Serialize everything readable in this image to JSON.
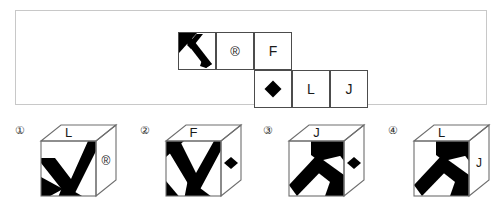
{
  "question_panel": {
    "name": "unfolded-cube-net",
    "net": {
      "rows": [
        {
          "row": 0,
          "cells": [
            {
              "col": 0,
              "kind": "k-arrow-glyph",
              "label": ""
            },
            {
              "col": 1,
              "kind": "text",
              "label": "®"
            },
            {
              "col": 2,
              "kind": "text",
              "label": "F"
            }
          ]
        },
        {
          "row": 1,
          "cells": [
            {
              "col": 2,
              "kind": "diamond-glyph",
              "label": ""
            },
            {
              "col": 3,
              "kind": "text",
              "label": "L"
            },
            {
              "col": 4,
              "kind": "text",
              "label": "J"
            }
          ]
        }
      ],
      "symbols": {
        "registered": "®",
        "diamond": "◆",
        "k_arrow": "k-arrow",
        "letter_f": "F",
        "letter_l": "L",
        "letter_j": "J"
      }
    }
  },
  "options": [
    {
      "number": "①",
      "number_plain": "1",
      "top_face_label": "L",
      "right_face_label": "®",
      "front_face_glyph": "k-arrow-rotated",
      "right_face_glyph": ""
    },
    {
      "number": "②",
      "number_plain": "2",
      "top_face_label": "F",
      "right_face_label": "",
      "front_face_glyph": "k-arrow-rotated",
      "right_face_glyph": "diamond"
    },
    {
      "number": "③",
      "number_plain": "3",
      "top_face_label": "J",
      "right_face_label": "",
      "front_face_glyph": "k-arrow-tilted",
      "right_face_glyph": "diamond"
    },
    {
      "number": "④",
      "number_plain": "4",
      "top_face_label": "L",
      "right_face_label": "J",
      "front_face_glyph": "k-arrow-tilted",
      "right_face_glyph": ""
    }
  ],
  "colors": {
    "ink": "#000000",
    "cell_border": "#4c4c4c",
    "panel_border": "#c8c8c8",
    "cube_line": "#6e6e6e",
    "background": "#ffffff"
  }
}
